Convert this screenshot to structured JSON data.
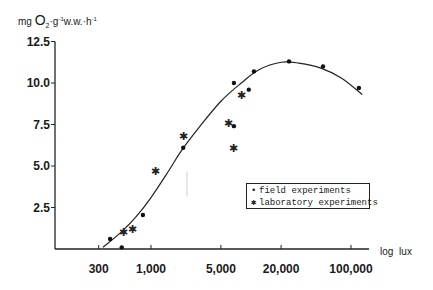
{
  "chart_data": {
    "type": "scatter",
    "title": "",
    "ylabel": "mg O2 · g-1 w.w. · h-1",
    "ylabel_parts": {
      "prefix": "mg",
      "big": "O",
      "sub": "2",
      "mid": "·g",
      "sup1": "-1",
      "ww": "w.w.·h",
      "sup2": "-1"
    },
    "xlabel": "log lux",
    "x_scale": "log",
    "xlim": [
      200,
      140000
    ],
    "ylim": [
      0,
      12.5
    ],
    "x_ticks": [
      300,
      1000,
      5000,
      20000,
      100000
    ],
    "x_tick_labels": [
      "300",
      "1,000",
      "5,000",
      "20,000",
      "100,000"
    ],
    "y_ticks": [
      2.5,
      5.0,
      7.5,
      10.0,
      12.5
    ],
    "y_tick_labels": [
      "2.5",
      "5.0",
      "7.5",
      "10.0",
      "12.5"
    ],
    "grid": false,
    "legend_position": "lower right (inside)",
    "series": [
      {
        "name": "field experiments",
        "marker": "dot",
        "x": [
          390,
          510,
          830,
          2100,
          6750,
          6750,
          9500,
          10700,
          24000,
          52500,
          120000
        ],
        "y": [
          0.6,
          0.1,
          2.05,
          6.1,
          7.4,
          10.0,
          9.6,
          10.7,
          11.3,
          11.0,
          9.7
        ]
      },
      {
        "name": "laboratory experiments",
        "marker": "asterisk",
        "x": [
          525,
          660,
          1100,
          2100,
          5900,
          6750,
          7950
        ],
        "y": [
          1.0,
          1.2,
          4.7,
          6.8,
          7.6,
          6.1,
          9.3
        ]
      },
      {
        "name": "fitted curve",
        "marker": "line",
        "x": [
          330,
          500,
          700,
          1000,
          1500,
          2000,
          3000,
          5000,
          8000,
          12000,
          20000,
          30000,
          50000,
          80000,
          130000
        ],
        "y": [
          0.1,
          1.0,
          1.9,
          3.1,
          4.7,
          5.9,
          7.3,
          8.9,
          10.0,
          10.8,
          11.25,
          11.2,
          10.9,
          10.3,
          9.3
        ]
      }
    ]
  },
  "legend": {
    "items": [
      {
        "symbol": "•",
        "label": "field experiments"
      },
      {
        "symbol": "✱",
        "label": "laboratory experiments"
      }
    ]
  }
}
